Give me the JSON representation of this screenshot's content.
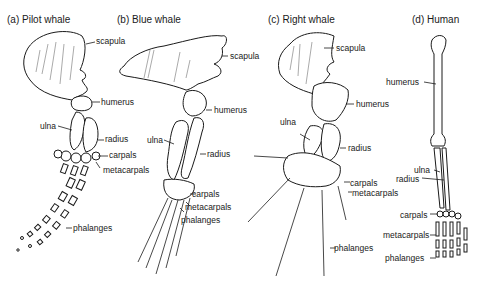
{
  "figure": {
    "panels": [
      {
        "id": "a",
        "title": "(a)  Pilot whale",
        "labels": {
          "scapula": "scapula",
          "humerus": "humerus",
          "ulna": "ulna",
          "radius": "radius",
          "carpals": "carpals",
          "metacarpals": "metacarpals",
          "phalanges": "phalanges"
        }
      },
      {
        "id": "b",
        "title": "(b)  Blue whale",
        "labels": {
          "scapula": "scapula",
          "humerus": "humerus",
          "ulna": "ulna",
          "radius": "radius",
          "carpals": "carpals",
          "metacarpals": "metacarpals",
          "phalanges": "phalanges"
        }
      },
      {
        "id": "c",
        "title": "(c)  Right whale",
        "labels": {
          "scapula": "scapula",
          "humerus": "humerus",
          "ulna": "ulna",
          "radius": "radius",
          "carpals": "carpals",
          "metacarpals": "metacarpals",
          "phalanges": "phalanges"
        }
      },
      {
        "id": "d",
        "title": "(d)  Human",
        "labels": {
          "humerus": "humerus",
          "ulna": "ulna",
          "radius": "radius",
          "carpals": "carpals",
          "metacarpals": "metacarpals",
          "phalanges": "phalanges"
        }
      }
    ],
    "colors": {
      "ink": "#1a1a1a",
      "background": "#ffffff"
    }
  }
}
